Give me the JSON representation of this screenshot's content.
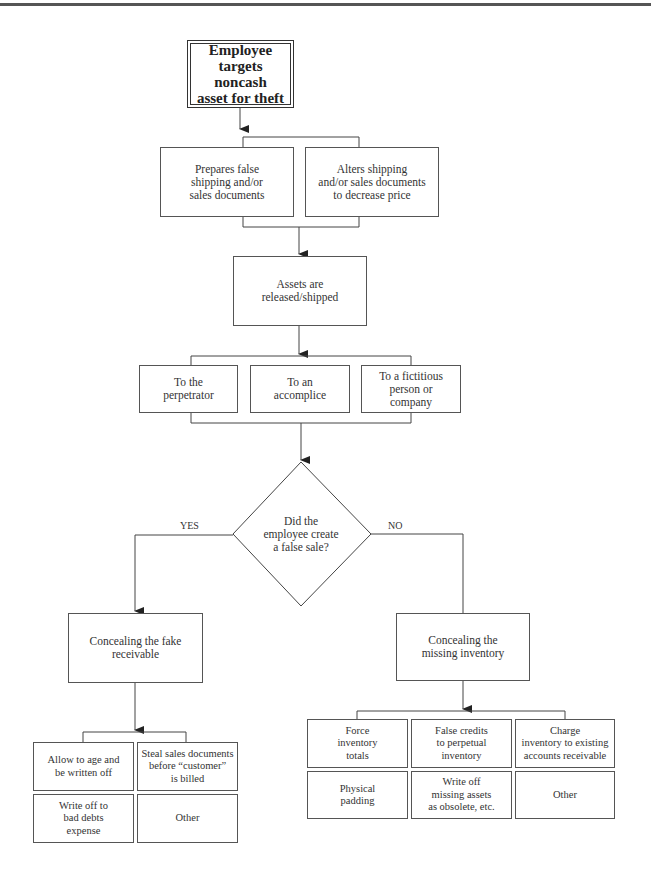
{
  "diagram": {
    "type": "flowchart",
    "start": {
      "label": "Employee\ntargets noncash\nasset for theft"
    },
    "step1_options": [
      {
        "label": "Prepares false\nshipping and/or\nsales documents"
      },
      {
        "label": "Alters shipping\nand/or sales documents\nto decrease price"
      }
    ],
    "step2": {
      "label": "Assets are\nreleased/shipped"
    },
    "step3_options": [
      {
        "label": "To the\nperpetrator"
      },
      {
        "label": "To an\naccomplice"
      },
      {
        "label": "To a fictitious\nperson or\ncompany"
      }
    ],
    "decision": {
      "label": "Did the\nemployee create\na false sale?",
      "yes_label": "YES",
      "no_label": "NO"
    },
    "yes_branch": {
      "label": "Concealing the fake\nreceivable",
      "options": [
        {
          "label": "Allow to age and\nbe written off"
        },
        {
          "label": "Steal sales documents\nbefore “customer”\nis billed"
        },
        {
          "label": "Write off to\nbad debts\nexpense"
        },
        {
          "label": "Other"
        }
      ]
    },
    "no_branch": {
      "label": "Concealing the\nmissing inventory",
      "options": [
        {
          "label": "Force\ninventory\ntotals"
        },
        {
          "label": "False credits\nto perpetual\ninventory"
        },
        {
          "label": "Charge\ninventory to existing\naccounts receivable"
        },
        {
          "label": "Physical\npadding"
        },
        {
          "label": "Write off\nmissing assets\nas obsolete, etc."
        },
        {
          "label": "Other"
        }
      ]
    },
    "colors": {
      "line": "#444444",
      "text": "#333333",
      "background": "#ffffff"
    }
  }
}
